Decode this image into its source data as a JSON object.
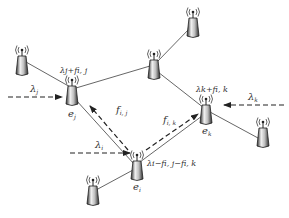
{
  "diagram": {
    "type": "wireless network flow diagram",
    "nodes": [
      {
        "id": "n_topleft",
        "label": "",
        "x": 22,
        "y": 66
      },
      {
        "id": "e_j",
        "label": "e_j",
        "x": 72,
        "y": 96
      },
      {
        "id": "n_mid",
        "label": "",
        "x": 154,
        "y": 69
      },
      {
        "id": "n_top",
        "label": "",
        "x": 194,
        "y": 24
      },
      {
        "id": "e_k",
        "label": "e_k",
        "x": 206,
        "y": 115
      },
      {
        "id": "n_right",
        "label": "",
        "x": 262,
        "y": 136
      },
      {
        "id": "e_i",
        "label": "e_i",
        "x": 136,
        "y": 171
      },
      {
        "id": "n_bottom",
        "label": "",
        "x": 93,
        "y": 196
      }
    ],
    "labels": {
      "e_j": "e",
      "e_j_sub": "j",
      "e_k": "e",
      "e_k_sub": "k",
      "e_i": "e",
      "e_i_sub": "i",
      "lambda_j": "λ",
      "lambda_j_sub": "j",
      "lambda_k": "λ",
      "lambda_k_sub": "k",
      "lambda_i": "λ",
      "lambda_i_sub": "i",
      "ej_load": "λj+fi, j",
      "ek_load": "λk+fi, k",
      "ei_load": "λi−fi, j−fi, k",
      "f_ij": "f",
      "f_ij_sub": "i, j",
      "f_ik": "f",
      "f_ik_sub": "i, k"
    },
    "colors": {
      "line": "#555555",
      "tower_light": "#e8e8e8",
      "tower_dark": "#333333",
      "text": "#333333"
    }
  }
}
